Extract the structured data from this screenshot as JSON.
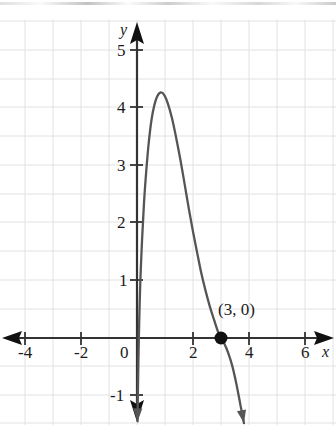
{
  "figure": {
    "axis_labels": {
      "x": "x",
      "y": "y"
    },
    "x_ticks": [
      {
        "value": -4,
        "label": "-4"
      },
      {
        "value": -2,
        "label": "-2"
      },
      {
        "value": 2,
        "label": "2"
      },
      {
        "value": 4,
        "label": "4"
      },
      {
        "value": 6,
        "label": "6"
      }
    ],
    "y_ticks": [
      {
        "value": 5,
        "label": "5"
      },
      {
        "value": 4,
        "label": "4"
      },
      {
        "value": 3,
        "label": "3"
      },
      {
        "value": 2,
        "label": "2"
      },
      {
        "value": 1,
        "label": "1"
      },
      {
        "value": -1,
        "label": "-1"
      }
    ],
    "origin_label": "0",
    "annotations": [
      {
        "text": "(3, 0)",
        "x": 3,
        "y": 0
      }
    ],
    "colors": {
      "curve": "#555555",
      "axis": "#333333",
      "grid": "#e2e2e6",
      "point": "#111111",
      "text": "#1a1a1a",
      "background": "#ffffff"
    }
  },
  "chart_data": {
    "type": "line",
    "title": "",
    "xlabel": "x",
    "ylabel": "y",
    "xlim": [
      -4.9,
      6.8
    ],
    "ylim": [
      -1.5,
      5.6
    ],
    "grid": true,
    "legend": null,
    "xticks": [
      -4,
      -2,
      2,
      4,
      6
    ],
    "yticks": [
      -1,
      1,
      2,
      3,
      4,
      5
    ],
    "series": [
      {
        "name": "curve",
        "points": [
          [
            0.02,
            -1.45
          ],
          [
            0.03,
            -1.0
          ],
          [
            0.05,
            -0.4
          ],
          [
            0.08,
            0.3
          ],
          [
            0.12,
            1.0
          ],
          [
            0.18,
            1.7
          ],
          [
            0.25,
            2.35
          ],
          [
            0.33,
            2.9
          ],
          [
            0.42,
            3.4
          ],
          [
            0.52,
            3.8
          ],
          [
            0.62,
            4.05
          ],
          [
            0.72,
            4.2
          ],
          [
            0.85,
            4.27
          ],
          [
            0.98,
            4.22
          ],
          [
            1.1,
            4.08
          ],
          [
            1.25,
            3.82
          ],
          [
            1.4,
            3.48
          ],
          [
            1.55,
            3.1
          ],
          [
            1.7,
            2.68
          ],
          [
            1.85,
            2.25
          ],
          [
            2.0,
            1.85
          ],
          [
            2.15,
            1.48
          ],
          [
            2.3,
            1.12
          ],
          [
            2.45,
            0.82
          ],
          [
            2.6,
            0.55
          ],
          [
            2.75,
            0.32
          ],
          [
            2.9,
            0.1
          ],
          [
            3.0,
            0.0
          ],
          [
            3.12,
            -0.1
          ],
          [
            3.25,
            -0.25
          ],
          [
            3.4,
            -0.48
          ],
          [
            3.55,
            -0.8
          ],
          [
            3.7,
            -1.18
          ],
          [
            3.82,
            -1.48
          ]
        ]
      }
    ],
    "marked_points": [
      {
        "x": 3,
        "y": 0,
        "label": "(3, 0)"
      }
    ],
    "annotations": [
      {
        "text": "(3, 0)",
        "x": 3,
        "y": 0
      }
    ]
  }
}
